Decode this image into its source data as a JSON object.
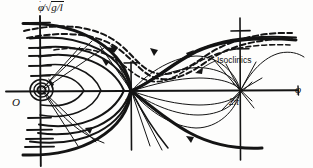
{
  "figure": {
    "background_color": "#fdfdfc",
    "ink_color": "#111111",
    "axes": {
      "y_label_numerator": "φ",
      "y_label_dot": "˙",
      "y_label_separator": "/",
      "y_label_radicand": "g/l",
      "y_label_full": "φ̇/√(g/l)",
      "x_label": "φ",
      "origin_label": "O",
      "x_tick_labels": [
        "π",
        "2π"
      ],
      "x_axis_y_px": 91,
      "y_axis_x_px": 40,
      "pi_x_px": 131,
      "twopi_x_px": 240,
      "y_tick_count_above": 6,
      "y_tick_count_below": 4
    },
    "annotations": [
      {
        "name": "isoclinics",
        "text": "Isoclinics",
        "x_px": 217,
        "y_px": 55,
        "leader_from": [
          215,
          62
        ],
        "leader_to": [
          196,
          72
        ],
        "arrow": true
      }
    ],
    "curve_groups": [
      {
        "name": "closed-orbits",
        "style": "solid",
        "description": "Nested closed libration orbits encircling the origin",
        "count": 6
      },
      {
        "name": "separatrix",
        "style": "solid-heavy",
        "description": "Heavy separatrix joining saddle points at π and 2π"
      },
      {
        "name": "running-trajectories",
        "style": "dashed",
        "description": "Dashed rotating (running) trajectories above the separatrix",
        "count": 3
      },
      {
        "name": "isoclinic-curves",
        "style": "thin-solid",
        "description": "Thin isoclinic curves forming lens shapes between π and 2π"
      }
    ],
    "flow_arrows": {
      "count": 7,
      "description": "Directional arrowheads indicating phase flow"
    }
  }
}
